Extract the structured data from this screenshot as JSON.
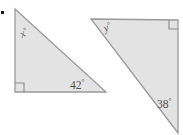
{
  "figure": {
    "width": 183,
    "height": 135,
    "background_color": "#ffffff",
    "shape_fill_color": "#e3e3e3",
    "shape_stroke_color": "#9a9a9a",
    "label_color": "#5b5b5b",
    "marker_color": "#8c8c8c",
    "bullet_color": "#1a1a1a"
  },
  "shapes": [
    {
      "name": "left-triangle",
      "type": "right-triangle",
      "points": "15,9 15,92 106,92",
      "right_angle_vertex": "bottom-left",
      "right_angle_mark_path": "M 15 83 L 24 83 L 24 92"
    },
    {
      "name": "right-triangle",
      "type": "right-triangle",
      "points": "91,19 178,20 178,133",
      "right_angle_vertex": "top-right",
      "right_angle_mark_path": "M 169 20 L 169 29 L 178 29"
    }
  ],
  "labels": [
    {
      "name": "angle-label-x",
      "text": "x",
      "degree": "°",
      "style": "variable",
      "x": 22,
      "y": 38,
      "rotate": -28,
      "shape": "left-triangle"
    },
    {
      "name": "angle-label-42",
      "text": "42",
      "degree": "°",
      "style": "numeric",
      "x": 70,
      "y": 89,
      "rotate": 0,
      "shape": "left-triangle"
    },
    {
      "name": "angle-label-y",
      "text": "y",
      "degree": "°",
      "style": "variable",
      "x": 105,
      "y": 32,
      "rotate": -22,
      "shape": "right-triangle"
    },
    {
      "name": "angle-label-38",
      "text": "38",
      "degree": "°",
      "style": "numeric",
      "x": 157,
      "y": 108,
      "rotate": 0,
      "shape": "right-triangle"
    }
  ],
  "bullet": {
    "name": "margin-bullet",
    "x": 1,
    "y": 11,
    "size": 3
  }
}
